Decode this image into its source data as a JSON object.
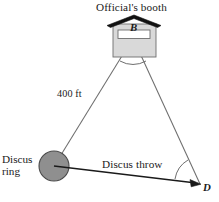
{
  "figure": {
    "title_label": "Official's booth",
    "vertex_b_label": "B",
    "vertex_d_label": "D",
    "distance_label": "400 ft",
    "ring_label_line1": "Discus",
    "ring_label_line2": "ring",
    "throw_label": "Discus throw",
    "colors": {
      "stroke": "#6e6e6e",
      "dark_stroke": "#1a1a1a",
      "roof_fill": "#111111",
      "booth_fill": "#d9d9d9",
      "booth_stroke": "#6e6e6e",
      "window_fill": "#ffffff",
      "ring_fill": "#8f8f8f",
      "ring_stroke": "#4a4a4a",
      "background": "#ffffff",
      "text": "#1a1a1a"
    },
    "geometry": {
      "vertex_b": [
        133,
        38
      ],
      "vertex_ring": [
        54,
        166
      ],
      "vertex_d": [
        200,
        184
      ],
      "ring_radius": 15,
      "booth_rect": [
        113,
        24,
        43,
        33
      ],
      "booth_window": [
        118,
        30,
        32,
        8
      ],
      "roof_peak": [
        134,
        16
      ],
      "roof_left_eave": [
        108,
        25
      ],
      "roof_right_eave": [
        160,
        25
      ]
    }
  }
}
